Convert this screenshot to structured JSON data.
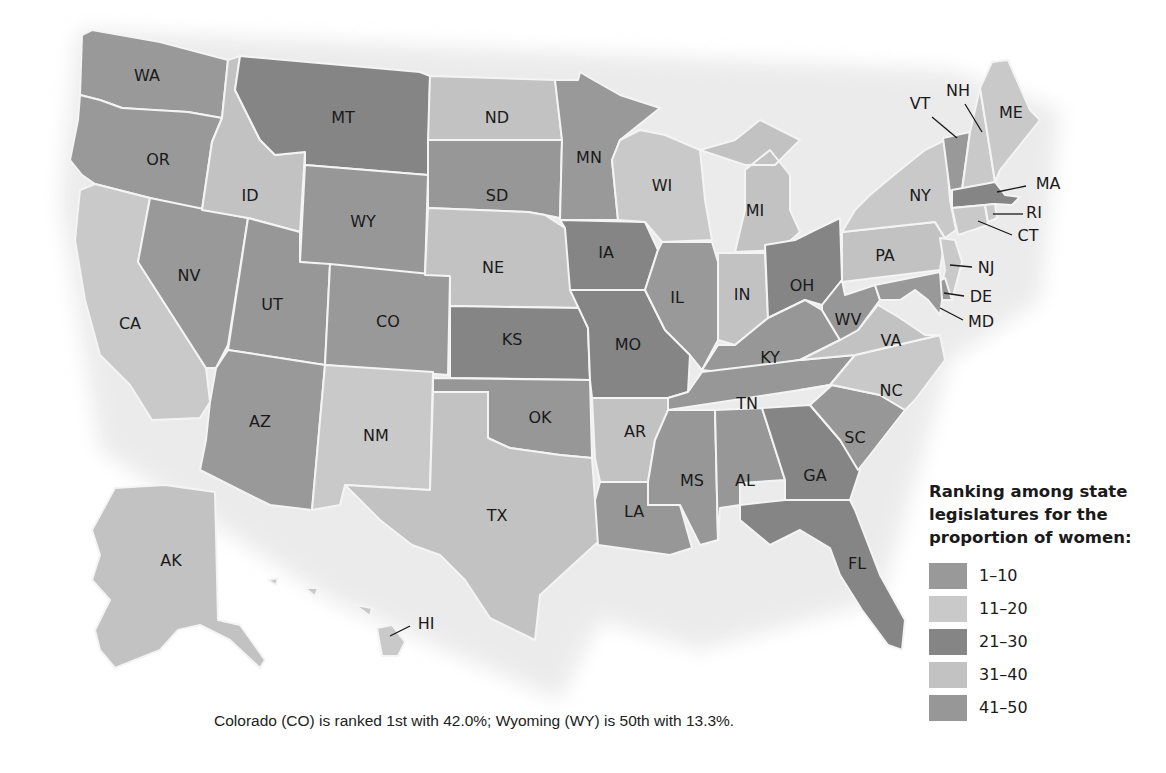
{
  "legend": {
    "title_lines": [
      "Ranking among state",
      "legislatures for the",
      "proportion of women:"
    ],
    "items": [
      {
        "label": "1–10",
        "color": "#999999"
      },
      {
        "label": "11–20",
        "color": "#c9c9c9"
      },
      {
        "label": "21–30",
        "color": "#858585"
      },
      {
        "label": "31–40",
        "color": "#c2c2c2"
      },
      {
        "label": "41–50",
        "color": "#979797"
      }
    ]
  },
  "caption": "Colorado (CO) is ranked 1st with 42.0%; Wyoming (WY) is 50th with 13.3%.",
  "states": {
    "WA": {
      "label": "WA",
      "rank_group": "1–10"
    },
    "OR": {
      "label": "OR",
      "rank_group": "1–10"
    },
    "CA": {
      "label": "CA",
      "rank_group": "11–20"
    },
    "NV": {
      "label": "NV",
      "rank_group": "1–10"
    },
    "ID": {
      "label": "ID",
      "rank_group": "31–40"
    },
    "MT": {
      "label": "MT",
      "rank_group": "21–30"
    },
    "WY": {
      "label": "WY",
      "rank_group": "41–50"
    },
    "UT": {
      "label": "UT",
      "rank_group": "41–50"
    },
    "AZ": {
      "label": "AZ",
      "rank_group": "1–10"
    },
    "CO": {
      "label": "CO",
      "rank_group": "1–10"
    },
    "NM": {
      "label": "NM",
      "rank_group": "11–20"
    },
    "ND": {
      "label": "ND",
      "rank_group": "31–40"
    },
    "SD": {
      "label": "SD",
      "rank_group": "41–50"
    },
    "NE": {
      "label": "NE",
      "rank_group": "31–40"
    },
    "KS": {
      "label": "KS",
      "rank_group": "21–30"
    },
    "OK": {
      "label": "OK",
      "rank_group": "41–50"
    },
    "TX": {
      "label": "TX",
      "rank_group": "31–40"
    },
    "MN": {
      "label": "MN",
      "rank_group": "1–10"
    },
    "IA": {
      "label": "IA",
      "rank_group": "21–30"
    },
    "MO": {
      "label": "MO",
      "rank_group": "21–30"
    },
    "AR": {
      "label": "AR",
      "rank_group": "31–40"
    },
    "LA": {
      "label": "LA",
      "rank_group": "41–50"
    },
    "WI": {
      "label": "WI",
      "rank_group": "11–20"
    },
    "IL": {
      "label": "IL",
      "rank_group": "1–10"
    },
    "MI": {
      "label": "MI",
      "rank_group": "31–40"
    },
    "IN": {
      "label": "IN",
      "rank_group": "31–40"
    },
    "OH": {
      "label": "OH",
      "rank_group": "21–30"
    },
    "KY": {
      "label": "KY",
      "rank_group": "41–50"
    },
    "TN": {
      "label": "TN",
      "rank_group": "41–50"
    },
    "MS": {
      "label": "MS",
      "rank_group": "41–50"
    },
    "AL": {
      "label": "AL",
      "rank_group": "41–50"
    },
    "GA": {
      "label": "GA",
      "rank_group": "21–30"
    },
    "FL": {
      "label": "FL",
      "rank_group": "21–30"
    },
    "SC": {
      "label": "SC",
      "rank_group": "41–50"
    },
    "NC": {
      "label": "NC",
      "rank_group": "11–20"
    },
    "VA": {
      "label": "VA",
      "rank_group": "31–40"
    },
    "WV": {
      "label": "WV",
      "rank_group": "41–50"
    },
    "PA": {
      "label": "PA",
      "rank_group": "31–40"
    },
    "NY": {
      "label": "NY",
      "rank_group": "11–20"
    },
    "VT": {
      "label": "VT",
      "rank_group": "1–10"
    },
    "NH": {
      "label": "NH",
      "rank_group": "11–20"
    },
    "ME": {
      "label": "ME",
      "rank_group": "11–20"
    },
    "MA": {
      "label": "MA",
      "rank_group": "21–30"
    },
    "RI": {
      "label": "RI",
      "rank_group": "11–20"
    },
    "CT": {
      "label": "CT",
      "rank_group": "11–20"
    },
    "NJ": {
      "label": "NJ",
      "rank_group": "11–20"
    },
    "DE": {
      "label": "DE",
      "rank_group": "1–10"
    },
    "MD": {
      "label": "MD",
      "rank_group": "1–10"
    },
    "AK": {
      "label": "AK",
      "rank_group": "31–40"
    },
    "HI": {
      "label": "HI",
      "rank_group": "11–20"
    }
  }
}
